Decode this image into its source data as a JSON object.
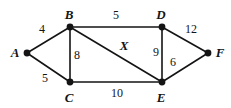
{
  "figure": {
    "kind": "weighted-undirected-graph-diagram",
    "background_color": "#ffffff",
    "stroke_color": "#141414",
    "width": 231,
    "height": 108
  },
  "nodes": [
    {
      "id": "A",
      "label": "A",
      "x": 27,
      "y": 53,
      "label_x": 15,
      "label_y": 52
    },
    {
      "id": "B",
      "label": "B",
      "x": 70,
      "y": 27,
      "label_x": 69,
      "label_y": 14
    },
    {
      "id": "C",
      "label": "C",
      "x": 70,
      "y": 82,
      "label_x": 69,
      "label_y": 97
    },
    {
      "id": "D",
      "label": "D",
      "x": 162,
      "y": 27,
      "label_x": 161,
      "label_y": 14
    },
    {
      "id": "E",
      "label": "E",
      "x": 162,
      "y": 82,
      "label_x": 161,
      "label_y": 97
    },
    {
      "id": "F",
      "label": "F",
      "x": 208,
      "y": 53,
      "label_x": 220,
      "label_y": 52
    }
  ],
  "edges": [
    {
      "from": "A",
      "to": "B",
      "weight": "4",
      "label_x": 42,
      "label_y": 29,
      "italic": false
    },
    {
      "from": "A",
      "to": "C",
      "weight": "5",
      "label_x": 45,
      "label_y": 78,
      "italic": false
    },
    {
      "from": "B",
      "to": "C",
      "weight": "8",
      "label_x": 77,
      "label_y": 55,
      "italic": false
    },
    {
      "from": "B",
      "to": "D",
      "weight": "5",
      "label_x": 116,
      "label_y": 15,
      "italic": false
    },
    {
      "from": "B",
      "to": "E",
      "weight": "X",
      "label_x": 124,
      "label_y": 45,
      "italic": true
    },
    {
      "from": "C",
      "to": "E",
      "weight": "10",
      "label_x": 117,
      "label_y": 93,
      "italic": false
    },
    {
      "from": "D",
      "to": "E",
      "weight": "9",
      "label_x": 156,
      "label_y": 52,
      "italic": false
    },
    {
      "from": "D",
      "to": "F",
      "weight": "12",
      "label_x": 191,
      "label_y": 29,
      "italic": false
    },
    {
      "from": "E",
      "to": "F",
      "weight": "6",
      "label_x": 173,
      "label_y": 62,
      "italic": false
    }
  ]
}
